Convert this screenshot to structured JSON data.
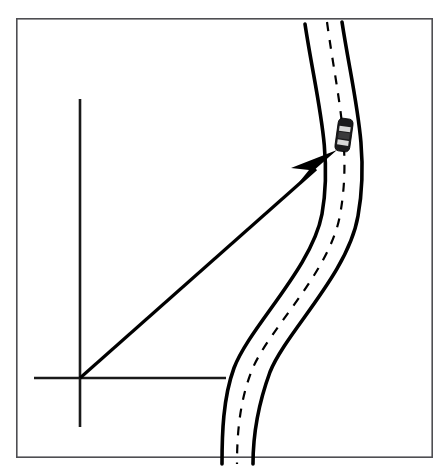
{
  "figure": {
    "title": "Vehicle position vector on a curved road",
    "canvas": {
      "width": 447,
      "height": 472,
      "background": "#ffffff"
    },
    "frame": {
      "label": "figure-border",
      "x": 16,
      "y": 18,
      "width": 417,
      "height": 440,
      "stroke_color": "#4e4e52",
      "stroke_width": 1.6
    },
    "coordinate_system": {
      "label": "reference-frame",
      "origin": {
        "x": 80,
        "y": 378
      },
      "vertical_axis": {
        "from_y": 99,
        "to_y": 427,
        "at_x": 80
      },
      "horizontal_axis": {
        "from_x": 34,
        "to_x": 226,
        "at_y": 378
      },
      "stroke_color": "#1a1a1a",
      "stroke_width": 2.6
    },
    "road": {
      "label": "curved-two-lane-road",
      "stroke_color": "#000000",
      "edge_stroke_width": 3.6,
      "centerline": {
        "label": "dashed-lane-divider",
        "style": "dashed",
        "dash_pattern": "9 9",
        "stroke_width": 2.2,
        "path": "M 327 22 C 337 95, 352 150, 340 215 C 330 272, 268 330, 252 370 C 240 400, 237 432, 237 464"
      },
      "left_edge": {
        "label": "road-left-edge",
        "path": "M 305 24 C 316 97, 333 152, 322 214 C 312 268, 250 326, 234 368 C 223 398, 222 434, 222 464"
      },
      "right_edge": {
        "label": "road-right-edge",
        "path": "M 342 22 C 353 94, 370 150, 358 216 C 348 274, 286 332, 270 372 C 259 402, 253 434, 253 464"
      }
    },
    "position_vector": {
      "label": "position-vector-arrow",
      "description": "arrow from coordinate origin to the vehicle",
      "start": {
        "x": 80,
        "y": 378
      },
      "tip": {
        "x": 337,
        "y": 150
      },
      "shaft_end": {
        "x": 316,
        "y": 169
      },
      "stroke_color": "#000000",
      "stroke_width": 3.2,
      "head_points": "337,150 291,168 309,170 296,186"
    },
    "vehicle": {
      "label": "car-top-view",
      "x": 337,
      "y": 119,
      "width": 14,
      "height": 32,
      "rotation_deg": 8,
      "body_color": "#1b1b1d",
      "glass_color": "#d8d8d8",
      "roof_color": "#3a3a3c"
    }
  }
}
